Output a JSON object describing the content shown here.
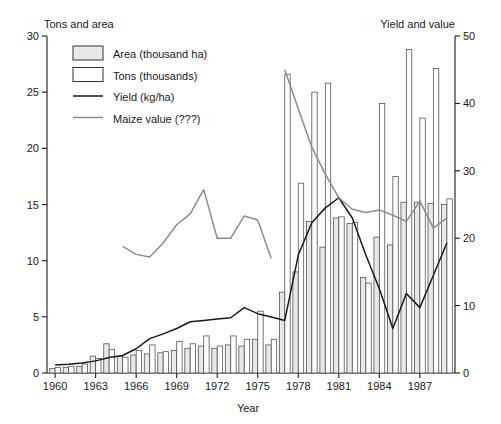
{
  "chart_data": {
    "type": "bar",
    "title": "",
    "xlabel": "Year",
    "ylabel_left": "Tons and area",
    "ylabel_right": "Yield and value",
    "ylim_left": [
      0,
      30
    ],
    "ylim_right": [
      0,
      50
    ],
    "xlim": [
      1959.4,
      1989.6
    ],
    "grid": false,
    "legend_position": "top-left-inside",
    "left_ticks": [
      0,
      5,
      10,
      15,
      20,
      25,
      30
    ],
    "right_ticks": [
      0,
      10,
      20,
      30,
      40,
      50
    ],
    "xtick_labels": [
      "1960",
      "1963",
      "1966",
      "1969",
      "1972",
      "1975",
      "1978",
      "1981",
      "1984",
      "1987"
    ],
    "xtick_values": [
      1960,
      1963,
      1966,
      1969,
      1972,
      1975,
      1978,
      1981,
      1984,
      1987
    ],
    "legend": [
      {
        "label": "Area (thousand ha)",
        "marker": "filled-rect",
        "color": "#e8e8e8"
      },
      {
        "label": "Tons (thousands)",
        "marker": "open-rect",
        "color": "#ffffff"
      },
      {
        "label": "Yield (kg/ha)",
        "marker": "line",
        "color": "#1a1a1a"
      },
      {
        "label": "Maize value (???)",
        "marker": "line",
        "color": "#8c8c8c"
      }
    ],
    "x": [
      1960,
      1961,
      1962,
      1963,
      1964,
      1965,
      1966,
      1967,
      1968,
      1969,
      1970,
      1971,
      1972,
      1973,
      1974,
      1975,
      1976,
      1977,
      1978,
      1979,
      1980,
      1981,
      1982,
      1983,
      1984,
      1985,
      1986,
      1987,
      1988,
      1989
    ],
    "series": [
      {
        "name": "Area (thousand ha)",
        "axis": "left",
        "type": "bar",
        "color": "#e8e8e8",
        "values": [
          0.4,
          0.5,
          0.6,
          1.5,
          2.6,
          1.5,
          1.6,
          1.7,
          1.8,
          2.0,
          2.2,
          2.4,
          2.2,
          2.5,
          2.4,
          3.0,
          2.5,
          7.2,
          9.0,
          13.5,
          11.2,
          13.8,
          13.3,
          8.5,
          12.1,
          11.4,
          15.2,
          15.2,
          15.1,
          15.0
        ]
      },
      {
        "name": "Tons (thousands)",
        "axis": "left",
        "type": "bar",
        "color": "#ffffff",
        "values": [
          0.5,
          0.6,
          0.8,
          1.3,
          2.1,
          1.4,
          2.0,
          2.5,
          1.9,
          2.8,
          2.6,
          3.3,
          2.4,
          3.3,
          3.0,
          5.5,
          3.0,
          26.6,
          16.9,
          25.0,
          25.8,
          13.9,
          13.4,
          8.0,
          24.0,
          17.5,
          28.8,
          22.7,
          27.1,
          15.5
        ]
      },
      {
        "name": "Yield (kg/ha)",
        "axis": "right",
        "type": "line",
        "color": "#1a1a1a",
        "values": [
          1.2,
          1.3,
          1.5,
          1.8,
          2.3,
          2.6,
          3.6,
          5.1,
          5.8,
          6.6,
          7.6,
          7.8,
          8.0,
          8.2,
          9.7,
          8.8,
          8.3,
          7.8,
          17.5,
          22.3,
          24.5,
          26.0,
          23.0,
          17.5,
          12.5,
          6.6,
          11.8,
          9.7,
          14.5,
          19.3
        ]
      },
      {
        "name": "Maize value (???)",
        "axis": "right",
        "type": "line",
        "color": "#8c8c8c",
        "values": [
          null,
          null,
          null,
          null,
          null,
          18.8,
          17.6,
          17.2,
          19.3,
          22.0,
          23.6,
          27.2,
          20.0,
          20.0,
          23.3,
          22.7,
          17.0,
          45.0,
          39.2,
          33.5,
          29.5,
          26.0,
          24.3,
          23.8,
          24.2,
          23.4,
          22.5,
          25.5,
          21.5,
          23.0
        ]
      }
    ],
    "notes": {
      "value_line_gap_between": [
        1976,
        1977
      ],
      "value_line_starts_at": 1965,
      "bars_paired": "area bar left, tons bar right, per year"
    }
  }
}
